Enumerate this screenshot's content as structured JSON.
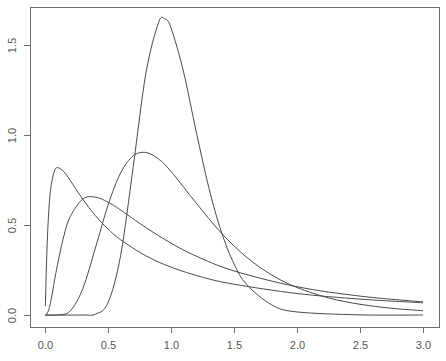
{
  "chart_data": {
    "type": "line",
    "title": "",
    "xlabel": "",
    "ylabel": "",
    "xlim": [
      0.0,
      3.0
    ],
    "ylim": [
      0.0,
      1.65
    ],
    "grid": false,
    "legend": null,
    "x_ticks": [
      0.0,
      0.5,
      1.0,
      1.5,
      2.0,
      2.5,
      3.0
    ],
    "x_tick_labels": [
      "0.0",
      "0.5",
      "1.0",
      "1.5",
      "2.0",
      "2.5",
      "3.0"
    ],
    "y_ticks": [
      0.0,
      0.5,
      1.0,
      1.5
    ],
    "y_tick_labels": [
      "0.0",
      "0.5",
      "1.0",
      "1.5"
    ],
    "series": [
      {
        "name": "curve-peak-0.82",
        "x": [
          0.003,
          0.01,
          0.02,
          0.035,
          0.05,
          0.075,
          0.1,
          0.15,
          0.2,
          0.3,
          0.4,
          0.5,
          0.6,
          0.8,
          1.0,
          1.25,
          1.5,
          2.0,
          2.5,
          3.0
        ],
        "y": [
          0.049,
          0.239,
          0.444,
          0.63,
          0.724,
          0.8,
          0.819,
          0.796,
          0.748,
          0.643,
          0.552,
          0.478,
          0.418,
          0.329,
          0.266,
          0.21,
          0.171,
          0.1195,
          0.0883,
          0.0678
        ]
      },
      {
        "name": "curve-peak-0.66",
        "x": [
          0.01,
          0.03,
          0.05,
          0.075,
          0.1,
          0.15,
          0.2,
          0.3,
          0.4,
          0.5,
          0.6,
          0.8,
          1.0,
          1.2,
          1.5,
          2.0,
          2.5,
          3.0
        ],
        "y": [
          0.001,
          0.03,
          0.0898,
          0.19,
          0.2815,
          0.44,
          0.546,
          0.644,
          0.655,
          0.627,
          0.583,
          0.486,
          0.399,
          0.327,
          0.245,
          0.157,
          0.105,
          0.0727
        ]
      },
      {
        "name": "curve-peak-0.90",
        "x": [
          0.0,
          0.1,
          0.2,
          0.3,
          0.4,
          0.5,
          0.6,
          0.7,
          0.8,
          0.9,
          1.0,
          1.2,
          1.4,
          1.6,
          1.8,
          2.0,
          2.25,
          2.5,
          2.75,
          3.0
        ],
        "y": [
          0.0,
          0.0002,
          0.0225,
          0.1465,
          0.372,
          0.61,
          0.789,
          0.884,
          0.903,
          0.867,
          0.798,
          0.622,
          0.455,
          0.321,
          0.222,
          0.153,
          0.095,
          0.0595,
          0.0374,
          0.0238
        ]
      },
      {
        "name": "curve-peak-1.65",
        "x": [
          0.0,
          0.3,
          0.4,
          0.5,
          0.6,
          0.7,
          0.8,
          0.9,
          0.95,
          1.0,
          1.1,
          1.2,
          1.3,
          1.4,
          1.5,
          1.6,
          1.8,
          2.0,
          2.5,
          3.0
        ],
        "y": [
          0.0,
          5e-05,
          0.0048,
          0.068,
          0.33,
          0.823,
          1.34,
          1.623,
          1.645,
          1.596,
          1.349,
          1.019,
          0.708,
          0.461,
          0.285,
          0.17,
          0.056,
          0.017,
          0.0008,
          0.0
        ]
      }
    ]
  },
  "colors": {
    "background": "#ffffff",
    "frame": "#6e6e6e",
    "curve": "#4a4a4a",
    "tick_label": "#555555"
  }
}
